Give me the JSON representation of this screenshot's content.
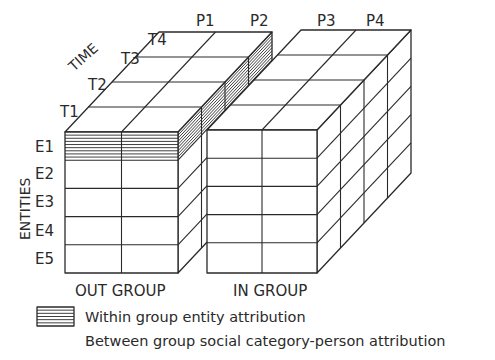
{
  "diagram": {
    "type": "3d-cube-matrix",
    "axes": {
      "time": {
        "label": "TIME",
        "ticks": [
          "T1",
          "T2",
          "T3",
          "T4"
        ]
      },
      "entities": {
        "label": "ENTITIES",
        "ticks": [
          "E1",
          "E2",
          "E3",
          "E4",
          "E5"
        ]
      },
      "persons": {
        "ticks": [
          "P1",
          "P2",
          "P3",
          "P4"
        ]
      }
    },
    "groups": [
      {
        "label": "OUT GROUP",
        "persons": [
          "P1",
          "P2"
        ]
      },
      {
        "label": "IN GROUP",
        "persons": [
          "P3",
          "P4"
        ]
      }
    ],
    "highlight": {
      "pattern": "horizontal-hatch",
      "entity": "E1",
      "group": "OUT GROUP"
    },
    "legend": [
      {
        "symbol": "hatch-swatch",
        "label": "Within group entity attribution"
      },
      {
        "symbol": "none",
        "label": "Between group social category-person attribution"
      }
    ],
    "colors": {
      "ink": "#2a2a2a",
      "background": "#ffffff"
    }
  }
}
